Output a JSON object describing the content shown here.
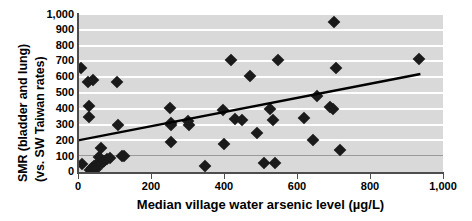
{
  "chart_data": {
    "type": "scatter",
    "title": "",
    "xlabel": "Median village water arsenic level (µg/L)",
    "ylabel": "SMR (bladder and lung) (vs. SW Taiwan rates)",
    "ylabel_lines": [
      "SMR (bladder and lung)",
      "(vs. SW Taiwan rates)"
    ],
    "xlim": [
      0,
      1000
    ],
    "ylim": [
      0,
      1000
    ],
    "xticks": [
      0,
      200,
      400,
      600,
      800,
      1000
    ],
    "xticklabels": [
      "0",
      "200",
      "400",
      "600",
      "800",
      "1,000"
    ],
    "yticks": [
      0,
      100,
      200,
      300,
      400,
      500,
      600,
      700,
      800,
      900,
      1000
    ],
    "yticklabels": [
      "0",
      "100",
      "200",
      "300",
      "400",
      "500",
      "600",
      "700",
      "800",
      "900",
      "1,000"
    ],
    "grid": "horizontal-white-bands-on-gray",
    "legend": "none",
    "marker": "filled-diamond",
    "marker_color": "#1a1a1a",
    "plot_background": "#d9d9d9",
    "gridline_color": "#ffffff",
    "points": [
      {
        "x": 8,
        "y": 660
      },
      {
        "x": 10,
        "y": 50
      },
      {
        "x": 28,
        "y": 570
      },
      {
        "x": 30,
        "y": 420
      },
      {
        "x": 30,
        "y": 345
      },
      {
        "x": 34,
        "y": 10
      },
      {
        "x": 38,
        "y": 25
      },
      {
        "x": 42,
        "y": 585
      },
      {
        "x": 44,
        "y": 35
      },
      {
        "x": 48,
        "y": 20
      },
      {
        "x": 55,
        "y": 55
      },
      {
        "x": 58,
        "y": 95
      },
      {
        "x": 62,
        "y": 150
      },
      {
        "x": 66,
        "y": 60
      },
      {
        "x": 72,
        "y": 70
      },
      {
        "x": 80,
        "y": 80
      },
      {
        "x": 88,
        "y": 90
      },
      {
        "x": 106,
        "y": 570
      },
      {
        "x": 110,
        "y": 295
      },
      {
        "x": 120,
        "y": 100
      },
      {
        "x": 126,
        "y": 102
      },
      {
        "x": 252,
        "y": 405
      },
      {
        "x": 255,
        "y": 310
      },
      {
        "x": 256,
        "y": 300
      },
      {
        "x": 256,
        "y": 190
      },
      {
        "x": 300,
        "y": 320
      },
      {
        "x": 305,
        "y": 300
      },
      {
        "x": 348,
        "y": 35
      },
      {
        "x": 398,
        "y": 390
      },
      {
        "x": 400,
        "y": 175
      },
      {
        "x": 420,
        "y": 710
      },
      {
        "x": 430,
        "y": 335
      },
      {
        "x": 450,
        "y": 330
      },
      {
        "x": 470,
        "y": 610
      },
      {
        "x": 490,
        "y": 245
      },
      {
        "x": 510,
        "y": 55
      },
      {
        "x": 525,
        "y": 400
      },
      {
        "x": 535,
        "y": 330
      },
      {
        "x": 540,
        "y": 55
      },
      {
        "x": 548,
        "y": 710
      },
      {
        "x": 620,
        "y": 340
      },
      {
        "x": 645,
        "y": 200
      },
      {
        "x": 655,
        "y": 480
      },
      {
        "x": 690,
        "y": 410
      },
      {
        "x": 698,
        "y": 400
      },
      {
        "x": 700,
        "y": 950
      },
      {
        "x": 708,
        "y": 660
      },
      {
        "x": 718,
        "y": 140
      },
      {
        "x": 935,
        "y": 715
      }
    ],
    "trendline": {
      "type": "linear-fit",
      "x_start": 0,
      "y_start": 200,
      "x_end": 938,
      "y_end": 620,
      "color": "#000000"
    }
  }
}
